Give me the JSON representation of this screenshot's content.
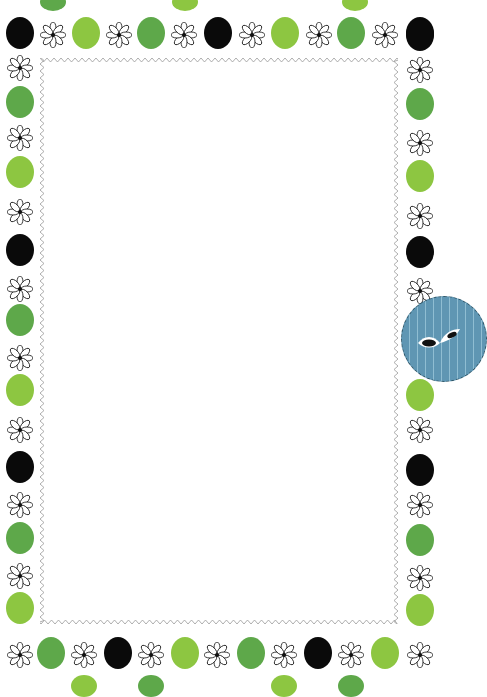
{
  "page": {
    "caption": "Blank frame"
  },
  "colors": {
    "background": "#ffffff",
    "green_dark": "#5ea84a",
    "green_lime": "#8dc641",
    "black": "#0a0a0a",
    "badge_blue": "#5f96b3",
    "zigzag_border": "#9a9a9a"
  },
  "frame": {
    "inner_panel": {
      "x": 40,
      "y": 58,
      "width": 358,
      "height": 566
    },
    "border_style": "zigzag"
  },
  "badge": {
    "icon": "leaf-icon",
    "x": 401,
    "y": 296,
    "diameter": 86
  }
}
